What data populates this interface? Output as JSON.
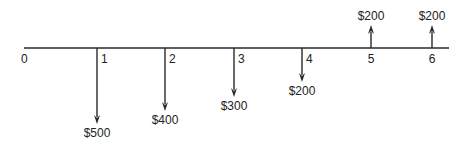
{
  "diagram": {
    "type": "cash-flow-diagram",
    "colors": {
      "line": "#2a2a2a",
      "text": "#222222",
      "background": "#ffffff"
    },
    "timeline": {
      "start_label": "0",
      "x_start": 24,
      "x_end": 449,
      "y": 48
    },
    "periods": [
      {
        "label": "0",
        "x": 24,
        "amount_label": null,
        "direction": "none",
        "tip_y": null
      },
      {
        "label": "1",
        "x": 97,
        "amount_label": "$500",
        "direction": "down",
        "tip_y": 124
      },
      {
        "label": "2",
        "x": 165,
        "amount_label": "$400",
        "direction": "down",
        "tip_y": 111
      },
      {
        "label": "3",
        "x": 234,
        "amount_label": "$300",
        "direction": "down",
        "tip_y": 97
      },
      {
        "label": "4",
        "x": 302,
        "amount_label": "$200",
        "direction": "down",
        "tip_y": 82
      },
      {
        "label": "5",
        "x": 371,
        "amount_label": "$200",
        "direction": "up",
        "tip_y": 25
      },
      {
        "label": "6",
        "x": 432,
        "amount_label": "$200",
        "direction": "up",
        "tip_y": 25
      }
    ]
  }
}
